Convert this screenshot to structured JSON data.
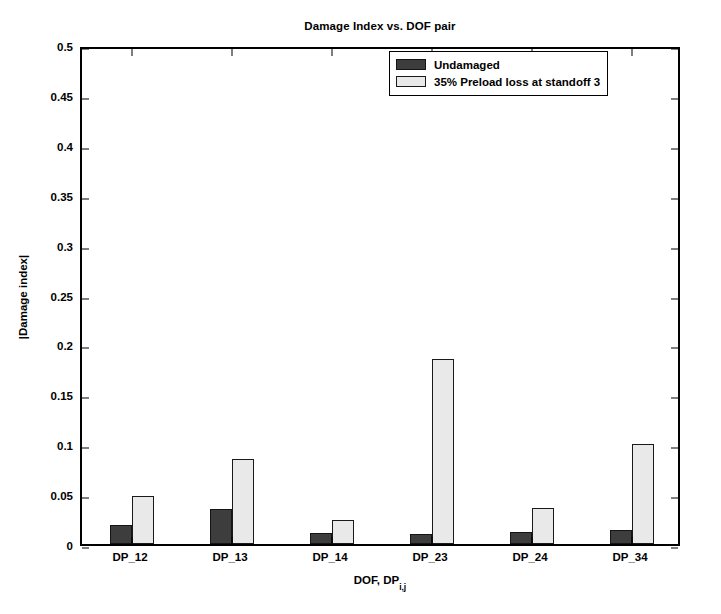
{
  "chart_data": {
    "type": "bar",
    "title": "Damage Index vs. DOF pair",
    "xlabel": "DOF, DP",
    "xlabel_subscript": "i,j",
    "ylabel": "|Damage index|",
    "categories": [
      "DP_12",
      "DP_13",
      "DP_14",
      "DP_23",
      "DP_24",
      "DP_34"
    ],
    "series": [
      {
        "name": "Undamaged",
        "color": "#3d3d3d",
        "values": [
          0.019,
          0.035,
          0.011,
          0.01,
          0.012,
          0.014
        ]
      },
      {
        "name": "35% Preload loss at standoff 3",
        "color": "#e9e9e9",
        "values": [
          0.048,
          0.085,
          0.024,
          0.185,
          0.036,
          0.1
        ]
      }
    ],
    "ylim": [
      0,
      0.5
    ],
    "ytick_values": [
      0,
      0.05,
      0.1,
      0.15,
      0.2,
      0.25,
      0.3,
      0.35,
      0.4,
      0.45,
      0.5
    ],
    "ytick_labels": [
      "0",
      "0.05",
      "0.1",
      "0.15",
      "0.2",
      "0.25",
      "0.3",
      "0.35",
      "0.4",
      "0.45",
      "0.5"
    ],
    "grid": false,
    "legend_position": "top-right",
    "axis_color": "#000000",
    "background_color": "#ffffff"
  }
}
